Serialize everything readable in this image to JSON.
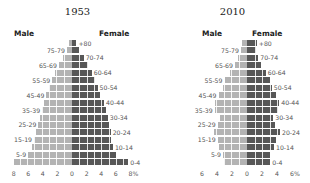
{
  "chart_data": [
    {
      "type": "bar",
      "subtype": "population-pyramid",
      "title": "1953",
      "left_label": "Male",
      "right_label": "Female",
      "categories": [
        "+80",
        "75-79",
        "70-74",
        "65-69",
        "60-64",
        "55-59",
        "50-54",
        "45-49",
        "40-44",
        "35-39",
        "30-34",
        "25-29",
        "20-24",
        "15-19",
        "10-14",
        "5-9",
        "0-4"
      ],
      "series": [
        {
          "name": "Male",
          "side": "left",
          "color": "#b3b3b3",
          "values": [
            0.4,
            0.7,
            1.3,
            1.8,
            2.3,
            2.7,
            3.1,
            3.5,
            3.9,
            4.1,
            4.4,
            4.6,
            4.9,
            5.2,
            5.5,
            6.0,
            8.0
          ]
        },
        {
          "name": "Female",
          "side": "right",
          "color": "#575757",
          "values": [
            0.6,
            1.0,
            1.6,
            2.2,
            2.7,
            3.1,
            3.5,
            3.9,
            4.4,
            4.7,
            4.9,
            5.1,
            5.3,
            5.4,
            5.6,
            6.0,
            7.7
          ]
        }
      ],
      "xticks": [
        "8",
        "6",
        "4",
        "2",
        "0",
        "2",
        "4",
        "6",
        "8%"
      ],
      "xlim": [
        -8,
        8
      ],
      "xlabel": "",
      "ylabel": "",
      "grid": true
    },
    {
      "type": "bar",
      "subtype": "population-pyramid",
      "title": "2010",
      "left_label": "Male",
      "right_label": "Female",
      "categories": [
        "+80",
        "75-79",
        "70-74",
        "65-69",
        "60-64",
        "55-59",
        "50-54",
        "45-49",
        "40-44",
        "35-39",
        "30-34",
        "25-29",
        "20-24",
        "15-19",
        "10-14",
        "5-9",
        "0-4"
      ],
      "series": [
        {
          "name": "Male",
          "side": "left",
          "color": "#b3b3b3",
          "values": [
            0.7,
            0.8,
            1.2,
            1.6,
            2.3,
            3.0,
            3.2,
            3.8,
            4.3,
            4.3,
            3.6,
            3.9,
            4.4,
            3.9,
            3.7,
            3.2,
            3.1
          ]
        },
        {
          "name": "Female",
          "side": "right",
          "color": "#575757",
          "values": [
            1.3,
            1.2,
            1.5,
            1.8,
            2.5,
            3.1,
            3.3,
            3.9,
            4.3,
            4.1,
            3.5,
            3.7,
            4.4,
            3.8,
            3.6,
            3.1,
            3.1
          ]
        }
      ],
      "xticks": [
        "6",
        "4",
        "2",
        "0",
        "2",
        "4",
        "6%"
      ],
      "xlim": [
        -6,
        6
      ],
      "xlabel": "",
      "ylabel": "",
      "grid": true
    }
  ],
  "panels": [
    {
      "title": "1953",
      "male": "Male",
      "female": "Female"
    },
    {
      "title": "2010",
      "male": "Male",
      "female": "Female"
    }
  ]
}
